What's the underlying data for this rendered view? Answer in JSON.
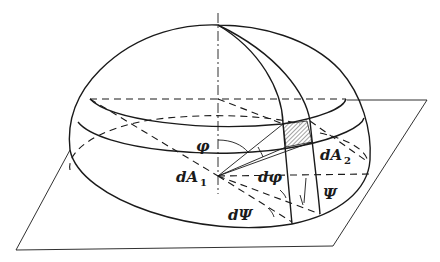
{
  "figure": {
    "labels": {
      "phi": "φ",
      "d_phi": "dφ",
      "d_psi": "dΨ",
      "psi": "Ψ",
      "dA1": "dA",
      "dA1_sub": "1",
      "dA2": "dA",
      "dA2_sub": "2"
    },
    "elements": [
      "hemisphere",
      "base-plane",
      "vertical-axis",
      "latitude-band",
      "meridian-lines",
      "hatched-area-dA2",
      "angle-arrows"
    ],
    "colors": {
      "ink": "#1a1a1a",
      "background": "#ffffff"
    }
  }
}
